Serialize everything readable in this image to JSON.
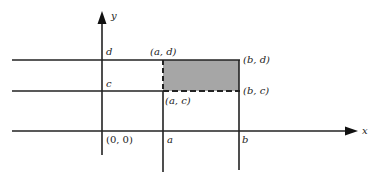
{
  "diagram": {
    "type": "coordinate-plane-rectangle",
    "axes": {
      "x_label": "x",
      "y_label": "y",
      "origin_label": "(0, 0)"
    },
    "ticks": {
      "x": [
        "a",
        "b"
      ],
      "y": [
        "c",
        "d"
      ]
    },
    "corners": {
      "top_left": "(a, d)",
      "top_right": "(b, d)",
      "bottom_left": "(a, c)",
      "bottom_right": "(b, c)"
    },
    "colors": {
      "line": "#222222",
      "fill": "#a6a6a6"
    }
  }
}
